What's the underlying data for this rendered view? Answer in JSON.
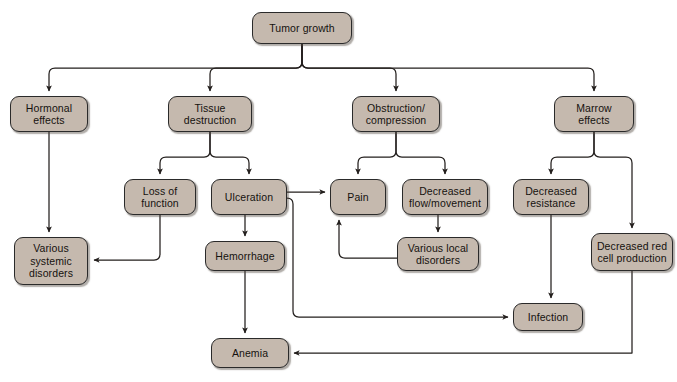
{
  "diagram": {
    "node_fill": "#c5b9ae",
    "node_stroke": "#2a2a2a",
    "connector_color": "#231f1d",
    "background": "#ffffff",
    "nodes": [
      {
        "id": "tumor_growth",
        "label": "Tumor growth",
        "x": 252,
        "y": 12,
        "w": 100,
        "h": 32
      },
      {
        "id": "hormonal",
        "label": "Hormonal\neffects",
        "x": 10,
        "y": 96,
        "w": 78,
        "h": 36
      },
      {
        "id": "tissue_destruction",
        "label": "Tissue\ndestruction",
        "x": 168,
        "y": 96,
        "w": 84,
        "h": 36
      },
      {
        "id": "obstruction",
        "label": "Obstruction/\ncompression",
        "x": 352,
        "y": 96,
        "w": 88,
        "h": 36
      },
      {
        "id": "marrow",
        "label": "Marrow\neffects",
        "x": 554,
        "y": 96,
        "w": 80,
        "h": 36
      },
      {
        "id": "loss_function",
        "label": "Loss of\nfunction",
        "x": 124,
        "y": 179,
        "w": 72,
        "h": 36
      },
      {
        "id": "ulceration",
        "label": "Ulceration",
        "x": 211,
        "y": 179,
        "w": 76,
        "h": 36
      },
      {
        "id": "pain",
        "label": "Pain",
        "x": 330,
        "y": 179,
        "w": 56,
        "h": 36
      },
      {
        "id": "decreased_flow",
        "label": "Decreased\nflow/movement",
        "x": 402,
        "y": 179,
        "w": 86,
        "h": 36
      },
      {
        "id": "decreased_resist",
        "label": "Decreased\nresistance",
        "x": 513,
        "y": 179,
        "w": 76,
        "h": 36
      },
      {
        "id": "various_systemic",
        "label": "Various\nsystemic\ndisorders",
        "x": 14,
        "y": 237,
        "w": 74,
        "h": 48
      },
      {
        "id": "hemorrhage",
        "label": "Hemorrhage",
        "x": 205,
        "y": 241,
        "w": 80,
        "h": 30
      },
      {
        "id": "various_local",
        "label": "Various local\ndisorders",
        "x": 397,
        "y": 237,
        "w": 82,
        "h": 34
      },
      {
        "id": "decreased_rbc",
        "label": "Decreased red\ncell production",
        "x": 591,
        "y": 233,
        "w": 82,
        "h": 38
      },
      {
        "id": "infection",
        "label": "Infection",
        "x": 513,
        "y": 303,
        "w": 70,
        "h": 28
      },
      {
        "id": "anemia",
        "label": "Anemia",
        "x": 211,
        "y": 338,
        "w": 78,
        "h": 30
      }
    ],
    "edges": [
      {
        "id": "tumor-to-hormonal",
        "from": "tumor_growth",
        "to": "hormonal"
      },
      {
        "id": "tumor-to-tissue-destruction",
        "from": "tumor_growth",
        "to": "tissue_destruction"
      },
      {
        "id": "tumor-to-obstruction",
        "from": "tumor_growth",
        "to": "obstruction"
      },
      {
        "id": "tumor-to-marrow",
        "from": "tumor_growth",
        "to": "marrow"
      },
      {
        "id": "hormonal-to-various-systemic",
        "from": "hormonal",
        "to": "various_systemic"
      },
      {
        "id": "tissue-to-loss-of-function",
        "from": "tissue_destruction",
        "to": "loss_function"
      },
      {
        "id": "tissue-to-ulceration",
        "from": "tissue_destruction",
        "to": "ulceration"
      },
      {
        "id": "obstruction-to-pain",
        "from": "obstruction",
        "to": "pain"
      },
      {
        "id": "obstruction-to-decreased-flow",
        "from": "obstruction",
        "to": "decreased_flow"
      },
      {
        "id": "marrow-to-decreased-resistance",
        "from": "marrow",
        "to": "decreased_resist"
      },
      {
        "id": "marrow-to-decreased-rbc",
        "from": "marrow",
        "to": "decreased_rbc"
      },
      {
        "id": "loss-of-function-to-various-systemic",
        "from": "loss_function",
        "to": "various_systemic"
      },
      {
        "id": "ulceration-to-hemorrhage",
        "from": "ulceration",
        "to": "hemorrhage"
      },
      {
        "id": "ulceration-to-pain",
        "from": "ulceration",
        "to": "pain"
      },
      {
        "id": "ulceration-to-infection",
        "from": "ulceration",
        "to": "infection"
      },
      {
        "id": "decreased-flow-to-various-local",
        "from": "decreased_flow",
        "to": "various_local"
      },
      {
        "id": "various-local-to-pain",
        "from": "various_local",
        "to": "pain"
      },
      {
        "id": "decreased-resistance-to-infection",
        "from": "decreased_resist",
        "to": "infection"
      },
      {
        "id": "hemorrhage-to-anemia",
        "from": "hemorrhage",
        "to": "anemia"
      },
      {
        "id": "decreased-rbc-to-anemia",
        "from": "decreased_rbc",
        "to": "anemia"
      }
    ]
  }
}
